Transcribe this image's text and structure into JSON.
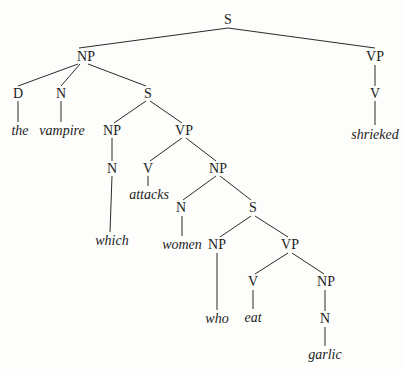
{
  "diagram": {
    "type": "syntax-tree",
    "nodes": [
      {
        "id": "s1",
        "label": "S",
        "x": 228,
        "y": 20,
        "kind": "cat"
      },
      {
        "id": "np1",
        "label": "NP",
        "x": 86,
        "y": 57,
        "kind": "cat"
      },
      {
        "id": "vp1",
        "label": "VP",
        "x": 375,
        "y": 57,
        "kind": "cat"
      },
      {
        "id": "d1",
        "label": "D",
        "x": 18,
        "y": 94,
        "kind": "cat"
      },
      {
        "id": "n1",
        "label": "N",
        "x": 61,
        "y": 94,
        "kind": "cat"
      },
      {
        "id": "s2",
        "label": "S",
        "x": 148,
        "y": 94,
        "kind": "cat"
      },
      {
        "id": "v1",
        "label": "V",
        "x": 375,
        "y": 94,
        "kind": "cat"
      },
      {
        "id": "w_the",
        "label": "the",
        "x": 20,
        "y": 131,
        "kind": "word"
      },
      {
        "id": "w_vampire",
        "label": "vampire",
        "x": 62,
        "y": 131,
        "kind": "word"
      },
      {
        "id": "w_shrieked",
        "label": "shrieked",
        "x": 375,
        "y": 135,
        "kind": "word"
      },
      {
        "id": "np2",
        "label": "NP",
        "x": 112,
        "y": 131,
        "kind": "cat"
      },
      {
        "id": "vp2",
        "label": "VP",
        "x": 184,
        "y": 131,
        "kind": "cat"
      },
      {
        "id": "n2",
        "label": "N",
        "x": 112,
        "y": 169,
        "kind": "cat"
      },
      {
        "id": "v2",
        "label": "V",
        "x": 148,
        "y": 169,
        "kind": "cat"
      },
      {
        "id": "np3",
        "label": "NP",
        "x": 218,
        "y": 169,
        "kind": "cat"
      },
      {
        "id": "w_attacks",
        "label": "attacks",
        "x": 149,
        "y": 195,
        "kind": "word"
      },
      {
        "id": "w_which",
        "label": "which",
        "x": 112,
        "y": 241,
        "kind": "word"
      },
      {
        "id": "n3",
        "label": "N",
        "x": 181,
        "y": 208,
        "kind": "cat"
      },
      {
        "id": "s3",
        "label": "S",
        "x": 253,
        "y": 208,
        "kind": "cat"
      },
      {
        "id": "w_women",
        "label": "women",
        "x": 182,
        "y": 245,
        "kind": "word"
      },
      {
        "id": "np4",
        "label": "NP",
        "x": 217,
        "y": 245,
        "kind": "cat"
      },
      {
        "id": "vp3",
        "label": "VP",
        "x": 290,
        "y": 245,
        "kind": "cat"
      },
      {
        "id": "v3",
        "label": "V",
        "x": 253,
        "y": 282,
        "kind": "cat"
      },
      {
        "id": "np5",
        "label": "NP",
        "x": 326,
        "y": 282,
        "kind": "cat"
      },
      {
        "id": "w_who",
        "label": "who",
        "x": 217,
        "y": 319,
        "kind": "word"
      },
      {
        "id": "w_eat",
        "label": "eat",
        "x": 253,
        "y": 318,
        "kind": "word"
      },
      {
        "id": "n4",
        "label": "N",
        "x": 325,
        "y": 319,
        "kind": "cat"
      },
      {
        "id": "w_garlic",
        "label": "garlic",
        "x": 325,
        "y": 355,
        "kind": "word"
      }
    ],
    "edges": [
      [
        228,
        28,
        79,
        48
      ],
      [
        228,
        28,
        375,
        48
      ],
      [
        78,
        64,
        18,
        86
      ],
      [
        80,
        64,
        61,
        86
      ],
      [
        88,
        64,
        146,
        86
      ],
      [
        375,
        65,
        375,
        86
      ],
      [
        18,
        101,
        18,
        122
      ],
      [
        61,
        101,
        61,
        122
      ],
      [
        146,
        101,
        114,
        123
      ],
      [
        150,
        101,
        182,
        123
      ],
      [
        375,
        101,
        375,
        125
      ],
      [
        112,
        138,
        112,
        161
      ],
      [
        182,
        138,
        150,
        161
      ],
      [
        186,
        138,
        216,
        161
      ],
      [
        112,
        176,
        110,
        232
      ],
      [
        148,
        176,
        148,
        186
      ],
      [
        216,
        176,
        183,
        200
      ],
      [
        220,
        176,
        251,
        200
      ],
      [
        182,
        216,
        182,
        236
      ],
      [
        251,
        216,
        220,
        237
      ],
      [
        255,
        216,
        288,
        237
      ],
      [
        217,
        253,
        217,
        310
      ],
      [
        288,
        253,
        255,
        274
      ],
      [
        292,
        253,
        324,
        274
      ],
      [
        253,
        290,
        253,
        309
      ],
      [
        325,
        290,
        325,
        311
      ],
      [
        325,
        327,
        325,
        346
      ]
    ],
    "stroke_color": "#2a2a2a"
  }
}
